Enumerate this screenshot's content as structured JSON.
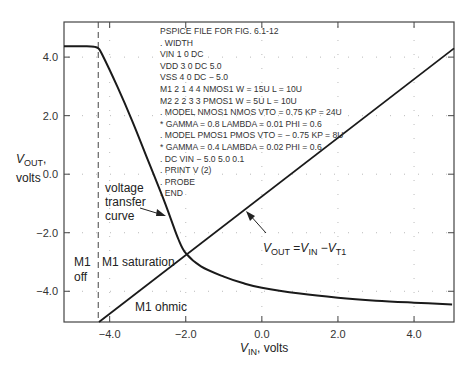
{
  "chart_data": {
    "type": "line",
    "title": "",
    "xlabel": "V_IN, volts",
    "ylabel": "V_OUT, volts",
    "xlim": [
      -5.2,
      5.05
    ],
    "ylim": [
      -5.05,
      5.2
    ],
    "x_ticks": [
      "-4.0",
      "-2.0",
      "0.0",
      "2.0",
      "4.0"
    ],
    "y_ticks": [
      "4.0",
      "2.0",
      "0.0",
      "-2.0",
      "-4.0"
    ],
    "grid": "dotted",
    "series": [
      {
        "name": "voltage transfer curve",
        "x": [
          -5.2,
          -4.6,
          -4.4,
          -4.3,
          -4.2,
          -3.8,
          -3.4,
          -3.0,
          -2.6,
          -2.4,
          -2.2,
          -2.0,
          -1.6,
          -1.0,
          -0.5,
          0.0,
          1.0,
          2.0,
          3.0,
          4.0,
          5.0
        ],
        "y": [
          4.37,
          4.37,
          4.35,
          4.3,
          4.1,
          3.0,
          1.8,
          0.5,
          -0.8,
          -1.5,
          -2.2,
          -2.7,
          -3.15,
          -3.5,
          -3.72,
          -3.88,
          -4.08,
          -4.22,
          -4.32,
          -4.39,
          -4.45
        ]
      },
      {
        "name": "V_OUT = V_IN - V_T1",
        "x": [
          -4.28,
          5.05
        ],
        "y": [
          -5.05,
          4.3
        ]
      }
    ],
    "vertical_marker": {
      "x": -4.3,
      "style": "dashed"
    },
    "annotations": [
      {
        "text": "voltage transfer curve",
        "arrow_to": [
          -2.35,
          -1.25
        ]
      },
      {
        "text": "V_OUT = V_IN - V_T1",
        "arrow_to": [
          -0.45,
          -1.2
        ]
      },
      {
        "text": "M1 off"
      },
      {
        "text": "M1 saturation"
      },
      {
        "text": "M1 ohmic"
      }
    ],
    "netlist": [
      "PSPICE FILE FOR FIG. 6.1-12",
      ". WIDTH",
      "VIN  1  0  DC",
      "VDD  3  0  DC 5.0",
      "VSS  4  0  DC  − 5.0",
      "M1  2  1  4  4  NMOS1  W = 15U  L = 10U",
      "M2  2  2  3  3  PMOS1  W = 5U  L = 10U",
      ". MODEL NMOS1 NMOS VTO = 0.75  KP = 24U",
      "* GAMMA = 0.8  LAMBDA = 0.01  PHI = 0.6",
      ". MODEL PMOS1 PMOS  VTO = − 0.75  KP = 8U",
      "* GAMMA = 0.4  LAMBDA = 0.02  PHI = 0.6",
      ". DC VIN − 5.0  5.0  0.1",
      ". PRINT  V (2)",
      ". PROBE",
      ". END"
    ]
  },
  "labels": {
    "y_axis_main": "V",
    "y_axis_sub": "OUT",
    "y_axis_unit": ", volts",
    "y_axis_line2": "volts",
    "x_axis_main": "V",
    "x_axis_sub": "IN",
    "x_axis_unit": ", volts",
    "vtc_line1": "voltage",
    "vtc_line2": "transfer",
    "vtc_line3": "curve",
    "m1_off_line1": "M1",
    "m1_off_line2": "off",
    "m1_saturation": "M1 saturation",
    "m1_ohmic": "M1 ohmic",
    "eq_vout": "V",
    "eq_vout_sub": "OUT",
    "eq_eq": " =",
    "eq_vin": "V",
    "eq_vin_sub": "IN",
    "eq_minus": " −",
    "eq_vt": "V",
    "eq_vt_sub": "T1"
  }
}
